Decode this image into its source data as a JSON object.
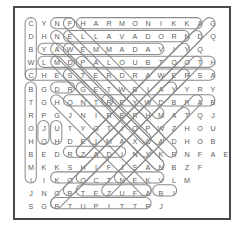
{
  "puzzle": {
    "title": "word-search-puzzle",
    "rows": 15,
    "cols": 16,
    "border_color": "#4a4a4a",
    "letter_color": "#5d5d5d",
    "ring_color": "#8b8b8b",
    "background_color": "#ffffff",
    "grid": [
      [
        "C",
        "Y",
        "N",
        "F",
        "H",
        "A",
        "R",
        "M",
        "O",
        "N",
        "I",
        "K",
        "K",
        "A",
        "G",
        ""
      ],
      [
        "D",
        "H",
        "N",
        "E",
        "L",
        "L",
        "A",
        "V",
        "A",
        "D",
        "O",
        "R",
        "N",
        "D",
        "Q",
        ""
      ],
      [
        "B",
        "Y",
        "A",
        "W",
        "E",
        "M",
        "M",
        "A",
        "D",
        "A",
        "V",
        "I",
        "Y",
        "Q",
        "",
        " "
      ],
      [
        "W",
        "L",
        "M",
        "D",
        "P",
        "A",
        "L",
        "O",
        "U",
        "B",
        "T",
        "O",
        "O",
        "T",
        "H",
        ""
      ],
      [
        "C",
        "H",
        "E",
        "S",
        "T",
        "E",
        "R",
        "D",
        "R",
        "A",
        "W",
        "E",
        "R",
        "S",
        "A",
        ""
      ],
      [
        "B",
        "G",
        "D",
        "R",
        "G",
        "E",
        "T",
        "W",
        "B",
        "I",
        "A",
        "Y",
        "Y",
        "R",
        "Y",
        ""
      ],
      [
        "T",
        "G",
        "H",
        "Q",
        "N",
        "T",
        "R",
        "E",
        "Y",
        "W",
        "D",
        "B",
        "R",
        "A",
        "B",
        ""
      ],
      [
        "R",
        "P",
        "G",
        "J",
        "N",
        "I",
        "R",
        "B",
        "R",
        "H",
        "M",
        "A",
        "T",
        "Q",
        "J",
        ""
      ],
      [
        "O",
        "J",
        "U",
        "T",
        "Y",
        "G",
        "T",
        "I",
        "O",
        "P",
        "W",
        "Z",
        "H",
        "O",
        "U",
        ""
      ],
      [
        "H",
        "O",
        "H",
        "D",
        "E",
        "I",
        "M",
        "A",
        "X",
        "C",
        "A",
        "D",
        "H",
        "O",
        "B",
        ""
      ],
      [
        "B",
        "E",
        "D",
        "R",
        "Z",
        "A",
        "D",
        "I",
        "N",
        "X",
        "K",
        "R",
        "N",
        "F",
        "A",
        "E"
      ],
      [
        "M",
        "K",
        "K",
        "S",
        "H",
        "I",
        "F",
        "J",
        "S",
        "A",
        "N",
        "B",
        "Z",
        "F",
        "",
        ""
      ],
      [
        "I",
        "I",
        "K",
        "O",
        "O",
        "C",
        "T",
        "N",
        "E",
        "K",
        "V",
        "L",
        "M",
        "",
        "",
        ""
      ],
      [
        "J",
        "N",
        "G",
        "B",
        "T",
        "E",
        "Z",
        "U",
        "F",
        "A",
        "B",
        "I",
        "",
        "",
        "",
        ""
      ],
      [
        "S",
        "G",
        "B",
        "T",
        "U",
        "P",
        "I",
        "T",
        "T",
        "P",
        "J",
        "",
        "",
        "",
        "",
        ""
      ]
    ],
    "found_words": [
      "HARMONIKKA",
      "ELLAVADOR",
      "WEMMADA",
      "PALOUBTOOTH",
      "CHESTERDRAWERS",
      "REYWDBRAB",
      "KOOCTNEK",
      "TEZUFABI",
      "BTUPITT",
      "DRZADIN"
    ]
  }
}
